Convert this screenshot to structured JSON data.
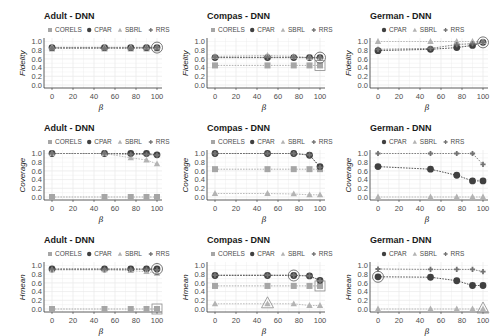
{
  "colors": {
    "CORELS": "#a6a6a6",
    "CPAR": "#404040",
    "SBRL": "#b3b3b3",
    "RRS": "#737373",
    "grid": "#ebebeb",
    "axis": "#333333"
  },
  "chart_data": [
    {
      "type": "line",
      "title": "Adult - DNN",
      "xlabel": "β",
      "ylabel": "Fidelity",
      "x": [
        0,
        50,
        75,
        90,
        100
      ],
      "xticks": [
        0,
        20,
        40,
        60,
        80,
        100
      ],
      "yticks": [
        "0.0",
        "0.2",
        "0.4",
        "0.6",
        "0.8",
        "1.0"
      ],
      "ylim": [
        0,
        1
      ],
      "grid": true,
      "legend_position": "top",
      "series": [
        {
          "name": "CORELS",
          "values": [
            0.84,
            0.84,
            0.84,
            0.84,
            0.84
          ]
        },
        {
          "name": "CPAR",
          "values": [
            0.86,
            0.86,
            0.86,
            0.86,
            0.86
          ]
        },
        {
          "name": "SBRL",
          "values": [
            0.87,
            0.87,
            0.87,
            0.87,
            0.87
          ]
        },
        {
          "name": "RRS",
          "values": [
            0.85,
            0.85,
            0.85,
            0.86,
            0.86
          ]
        }
      ],
      "highlight": [
        {
          "series": "CPAR",
          "x": 100
        }
      ]
    },
    {
      "type": "line",
      "title": "Compas - DNN",
      "xlabel": "β",
      "ylabel": "Fidelity",
      "x": [
        0,
        50,
        75,
        90,
        100
      ],
      "xticks": [
        0,
        20,
        40,
        60,
        80,
        100
      ],
      "yticks": [
        "0.0",
        "0.2",
        "0.4",
        "0.6",
        "0.8",
        "1.0"
      ],
      "ylim": [
        0,
        1
      ],
      "grid": true,
      "legend_position": "top",
      "series": [
        {
          "name": "CORELS",
          "values": [
            0.45,
            0.45,
            0.45,
            0.45,
            0.45
          ]
        },
        {
          "name": "CPAR",
          "values": [
            0.63,
            0.63,
            0.63,
            0.63,
            0.63
          ]
        },
        {
          "name": "SBRL",
          "values": [
            0.66,
            0.68,
            0.66,
            0.63,
            0.63
          ]
        },
        {
          "name": "RRS",
          "values": [
            0.64,
            0.64,
            0.64,
            0.63,
            0.63
          ]
        }
      ],
      "highlight": [
        {
          "series": "CPAR",
          "x": 100
        },
        {
          "series": "CORELS",
          "x": 100
        }
      ]
    },
    {
      "type": "line",
      "title": "German - DNN",
      "xlabel": "β",
      "ylabel": "Fidelity",
      "x": [
        0,
        50,
        75,
        90,
        100
      ],
      "xticks": [
        0,
        20,
        40,
        60,
        80,
        100
      ],
      "yticks": [
        "0.0",
        "0.2",
        "0.4",
        "0.6",
        "0.8",
        "1.0"
      ],
      "ylim": [
        0,
        1
      ],
      "grid": true,
      "legend_position": "top",
      "series": [
        {
          "name": "CPAR",
          "values": [
            0.79,
            0.82,
            0.86,
            0.91,
            0.98
          ]
        },
        {
          "name": "SBRL",
          "values": [
            1.0,
            1.0,
            1.0,
            1.0,
            1.0
          ]
        },
        {
          "name": "RRS",
          "values": [
            0.82,
            0.84,
            0.93,
            0.95,
            0.98
          ]
        }
      ],
      "highlight": [
        {
          "series": "CPAR",
          "x": 100
        }
      ]
    },
    {
      "type": "line",
      "title": "Adult - DNN",
      "xlabel": "β",
      "ylabel": "Coverage",
      "x": [
        0,
        50,
        75,
        90,
        100
      ],
      "xticks": [
        0,
        20,
        40,
        60,
        80,
        100
      ],
      "yticks": [
        "0.0",
        "0.2",
        "0.4",
        "0.6",
        "0.8",
        "1.0"
      ],
      "ylim": [
        0,
        1
      ],
      "grid": true,
      "legend_position": "top",
      "series": [
        {
          "name": "CORELS",
          "values": [
            0.0,
            0.0,
            0.0,
            0.0,
            0.0
          ]
        },
        {
          "name": "CPAR",
          "values": [
            1.0,
            1.0,
            1.0,
            1.0,
            0.97
          ]
        },
        {
          "name": "SBRL",
          "values": [
            1.0,
            1.0,
            0.9,
            0.85,
            0.76
          ]
        },
        {
          "name": "RRS",
          "values": [
            1.0,
            1.0,
            0.98,
            0.98,
            0.96
          ]
        }
      ]
    },
    {
      "type": "line",
      "title": "Compas - DNN",
      "xlabel": "β",
      "ylabel": "Coverage",
      "x": [
        0,
        50,
        75,
        90,
        100
      ],
      "xticks": [
        0,
        20,
        40,
        60,
        80,
        100
      ],
      "yticks": [
        "0.0",
        "0.2",
        "0.4",
        "0.6",
        "0.8",
        "1.0"
      ],
      "ylim": [
        0,
        1
      ],
      "grid": true,
      "legend_position": "top",
      "series": [
        {
          "name": "CORELS",
          "values": [
            0.64,
            0.64,
            0.64,
            0.64,
            0.64
          ]
        },
        {
          "name": "CPAR",
          "values": [
            1.0,
            1.0,
            1.0,
            0.96,
            0.7
          ]
        },
        {
          "name": "SBRL",
          "values": [
            0.08,
            0.08,
            0.07,
            0.05,
            0.05
          ]
        },
        {
          "name": "RRS",
          "values": [
            1.0,
            1.0,
            1.0,
            0.97,
            0.68
          ]
        }
      ]
    },
    {
      "type": "line",
      "title": "German - DNN",
      "xlabel": "β",
      "ylabel": "Coverage",
      "x": [
        0,
        50,
        75,
        90,
        100
      ],
      "xticks": [
        0,
        20,
        40,
        60,
        80,
        100
      ],
      "yticks": [
        "0.0",
        "0.2",
        "0.4",
        "0.6",
        "0.8",
        "1.0"
      ],
      "ylim": [
        0,
        1
      ],
      "grid": true,
      "legend_position": "top",
      "series": [
        {
          "name": "CPAR",
          "values": [
            0.7,
            0.64,
            0.5,
            0.37,
            0.37
          ]
        },
        {
          "name": "SBRL",
          "values": [
            0.0,
            0.0,
            0.0,
            0.0,
            0.0
          ]
        },
        {
          "name": "RRS",
          "values": [
            1.0,
            1.0,
            1.0,
            1.0,
            0.75
          ]
        }
      ]
    },
    {
      "type": "line",
      "title": "Adult - DNN",
      "xlabel": "β",
      "ylabel": "Hmean",
      "x": [
        0,
        50,
        75,
        90,
        100
      ],
      "xticks": [
        0,
        20,
        40,
        60,
        80,
        100
      ],
      "yticks": [
        "0.0",
        "0.2",
        "0.4",
        "0.6",
        "0.8",
        "1.0"
      ],
      "ylim": [
        0,
        1
      ],
      "grid": true,
      "legend_position": "top",
      "series": [
        {
          "name": "CORELS",
          "values": [
            0.0,
            0.0,
            0.0,
            0.0,
            0.0
          ]
        },
        {
          "name": "CPAR",
          "values": [
            0.92,
            0.92,
            0.92,
            0.92,
            0.92
          ]
        },
        {
          "name": "SBRL",
          "values": [
            0.9,
            0.9,
            0.88,
            0.86,
            0.82
          ]
        },
        {
          "name": "RRS",
          "values": [
            0.91,
            0.91,
            0.91,
            0.91,
            0.9
          ]
        }
      ],
      "highlight": [
        {
          "series": "CPAR",
          "x": 100
        },
        {
          "series": "CORELS",
          "x": 100
        }
      ]
    },
    {
      "type": "line",
      "title": "Compas - DNN",
      "xlabel": "β",
      "ylabel": "Hmean",
      "x": [
        0,
        50,
        75,
        90,
        100
      ],
      "xticks": [
        0,
        20,
        40,
        60,
        80,
        100
      ],
      "yticks": [
        "0.0",
        "0.2",
        "0.4",
        "0.6",
        "0.8",
        "1.0"
      ],
      "ylim": [
        0,
        1
      ],
      "grid": true,
      "legend_position": "top",
      "series": [
        {
          "name": "CORELS",
          "values": [
            0.53,
            0.53,
            0.53,
            0.53,
            0.53
          ]
        },
        {
          "name": "CPAR",
          "values": [
            0.77,
            0.77,
            0.77,
            0.76,
            0.66
          ]
        },
        {
          "name": "SBRL",
          "values": [
            0.12,
            0.12,
            0.12,
            0.08,
            0.08
          ]
        },
        {
          "name": "RRS",
          "values": [
            0.78,
            0.78,
            0.78,
            0.76,
            0.65
          ]
        }
      ],
      "highlight": [
        {
          "series": "CPAR",
          "x": 75
        },
        {
          "series": "SBRL",
          "x": 50
        },
        {
          "series": "CORELS",
          "x": 100
        }
      ]
    },
    {
      "type": "line",
      "title": "German - DNN",
      "xlabel": "β",
      "ylabel": "Hmean",
      "x": [
        0,
        50,
        75,
        90,
        100
      ],
      "xticks": [
        0,
        20,
        40,
        60,
        80,
        100
      ],
      "yticks": [
        "0.0",
        "0.2",
        "0.4",
        "0.6",
        "0.8",
        "1.0"
      ],
      "ylim": [
        0,
        1
      ],
      "grid": true,
      "legend_position": "top",
      "series": [
        {
          "name": "CPAR",
          "values": [
            0.74,
            0.73,
            0.65,
            0.54,
            0.54
          ]
        },
        {
          "name": "SBRL",
          "values": [
            0.0,
            0.0,
            0.0,
            0.0,
            0.0
          ]
        },
        {
          "name": "RRS",
          "values": [
            0.92,
            0.91,
            0.91,
            0.91,
            0.86
          ]
        }
      ],
      "highlight": [
        {
          "series": "CPAR",
          "x": 0
        },
        {
          "series": "SBRL",
          "x": 100
        }
      ]
    }
  ]
}
